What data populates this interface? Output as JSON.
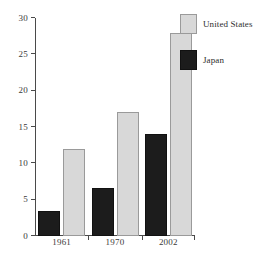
{
  "chart_data": {
    "type": "bar",
    "title": "",
    "subtitle": "",
    "xlabel": "",
    "ylabel": "",
    "categories": [
      "1961",
      "1970",
      "2002"
    ],
    "series": [
      {
        "name": "Japan",
        "values": [
          3.5,
          6.6,
          14
        ],
        "color": "#1c1c1c"
      },
      {
        "name": "United States",
        "values": [
          12,
          17,
          28
        ],
        "color": "#d8d8d8"
      }
    ],
    "ylim": [
      0,
      30
    ],
    "yticks": [
      0,
      5,
      10,
      15,
      20,
      25,
      30
    ],
    "ytick_labels": [
      "0",
      "5",
      "10",
      "15",
      "20",
      "25",
      "30"
    ],
    "grid": false,
    "legend_position": "top-right",
    "legend_entries": [
      {
        "label": "United States",
        "color": "#d8d8d8"
      },
      {
        "label": "Japan",
        "color": "#1c1c1c"
      }
    ],
    "bar_order_in_group": [
      "Japan",
      "United States"
    ]
  },
  "axes": {
    "y": {
      "ticks": [
        {
          "value": 0,
          "label": "0"
        },
        {
          "value": 5,
          "label": "5"
        },
        {
          "value": 10,
          "label": "10"
        },
        {
          "value": 15,
          "label": "15"
        },
        {
          "value": 20,
          "label": "20"
        },
        {
          "value": 25,
          "label": "25"
        },
        {
          "value": 30,
          "label": "30"
        }
      ]
    },
    "x": {
      "categories": [
        "1961",
        "1970",
        "2002"
      ]
    }
  },
  "legend": {
    "entries": [
      {
        "label": "United States",
        "series": "us"
      },
      {
        "label": "Japan",
        "series": "japan"
      }
    ]
  }
}
